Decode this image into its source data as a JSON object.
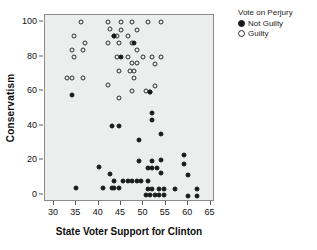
{
  "chart_data": {
    "type": "scatter",
    "title": "",
    "xlabel": "State Voter Support for Clinton",
    "ylabel": "Conservatism",
    "xlim": [
      28,
      66
    ],
    "ylim": [
      -4,
      104
    ],
    "xticks": [
      30,
      35,
      40,
      45,
      50,
      55,
      60,
      65
    ],
    "yticks": [
      0,
      20,
      40,
      60,
      80,
      100
    ],
    "grid": false,
    "legend": {
      "title": "Vote on Perjury",
      "position": "right-top",
      "entries": [
        {
          "name": "Not Guilty",
          "marker": "filled-circle",
          "color": "#1a1a1a"
        },
        {
          "name": "Guilty",
          "marker": "open-circle",
          "color": "#2b2b2b"
        }
      ]
    },
    "series": [
      {
        "name": "Guilty",
        "marker": "open-circle",
        "points": [
          [
            36,
            100
          ],
          [
            42,
            100
          ],
          [
            45,
            100
          ],
          [
            47.5,
            100
          ],
          [
            51,
            100
          ],
          [
            54,
            100
          ],
          [
            42.5,
            96
          ],
          [
            45,
            95.5
          ],
          [
            48.5,
            95.5
          ],
          [
            34.5,
            92
          ],
          [
            43.5,
            92
          ],
          [
            44,
            92
          ],
          [
            46.5,
            92
          ],
          [
            37,
            88
          ],
          [
            42,
            88
          ],
          [
            44.5,
            88
          ],
          [
            47.5,
            88
          ],
          [
            34,
            84
          ],
          [
            36.5,
            84
          ],
          [
            48.5,
            84
          ],
          [
            34.5,
            80
          ],
          [
            44,
            80
          ],
          [
            46.5,
            80
          ],
          [
            50,
            79.5
          ],
          [
            52,
            79.5
          ],
          [
            54,
            79.5
          ],
          [
            47.5,
            76
          ],
          [
            48.5,
            76
          ],
          [
            52.5,
            75.5
          ],
          [
            44.5,
            71.5
          ],
          [
            47,
            71.5
          ],
          [
            48,
            71.5
          ],
          [
            33,
            67.5
          ],
          [
            34,
            67.5
          ],
          [
            36.5,
            67.5
          ],
          [
            48,
            67.5
          ],
          [
            42,
            63.5
          ],
          [
            52.5,
            63
          ],
          [
            44.5,
            56
          ],
          [
            47.5,
            60
          ],
          [
            50.5,
            60
          ],
          [
            51.5,
            59.5
          ]
        ]
      },
      {
        "name": "Not Guilty",
        "marker": "filled-circle",
        "points": [
          [
            34,
            58
          ],
          [
            43.5,
            92
          ],
          [
            48,
            88
          ],
          [
            45,
            79.5
          ],
          [
            51.5,
            59.5
          ],
          [
            52,
            47.5
          ],
          [
            52,
            43.5
          ],
          [
            43,
            40
          ],
          [
            44.5,
            40
          ],
          [
            54,
            35.5
          ],
          [
            49,
            32
          ],
          [
            59,
            23
          ],
          [
            49,
            19.5
          ],
          [
            52,
            19.5
          ],
          [
            54,
            20.5
          ],
          [
            59,
            18
          ],
          [
            40,
            16
          ],
          [
            51,
            15.5
          ],
          [
            52,
            15.5
          ],
          [
            53,
            15.5
          ],
          [
            54,
            12.5
          ],
          [
            60,
            11.5
          ],
          [
            42.5,
            12
          ],
          [
            43.5,
            8
          ],
          [
            45.5,
            8
          ],
          [
            46.5,
            8
          ],
          [
            47.5,
            8
          ],
          [
            48.5,
            8
          ],
          [
            49.5,
            8
          ],
          [
            51,
            8
          ],
          [
            35,
            4
          ],
          [
            41,
            4
          ],
          [
            43,
            4
          ],
          [
            43.5,
            4
          ],
          [
            44.5,
            4
          ],
          [
            51,
            3.5
          ],
          [
            52,
            3.5
          ],
          [
            53.5,
            3.5
          ],
          [
            54.5,
            3.5
          ],
          [
            57,
            3.5
          ],
          [
            62,
            3.5
          ],
          [
            50.5,
            0
          ],
          [
            51.5,
            0
          ],
          [
            52.5,
            0
          ],
          [
            53.5,
            0
          ],
          [
            54.5,
            0
          ],
          [
            60,
            -0.5
          ],
          [
            62,
            -0.5
          ]
        ]
      }
    ]
  }
}
